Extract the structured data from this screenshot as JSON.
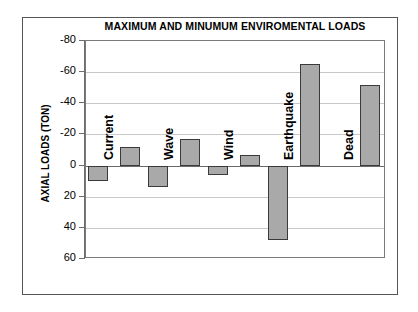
{
  "chart_data": {
    "type": "bar",
    "title": "MAXIMUM AND MINUMUM ENVIROMENTAL LOADS",
    "xlabel": "",
    "ylabel": "AXIAL LOADS (TON)",
    "ylim": [
      -80,
      60
    ],
    "y_axis_inverted": true,
    "yticks": [
      -80,
      -60,
      -40,
      -20,
      0,
      20,
      40,
      60
    ],
    "ytick_labels": [
      "-80",
      "-60",
      "-40",
      "-20",
      "0",
      "20",
      "40",
      "60"
    ],
    "grid": true,
    "legend": "none",
    "categories": [
      "Current",
      "Wave",
      "Wind",
      "Earthquake",
      "Dead"
    ],
    "series": [
      {
        "name": "Minimum",
        "values": [
          10,
          14,
          6,
          48,
          null
        ]
      },
      {
        "name": "Maximum",
        "values": [
          -12,
          -17,
          -7,
          -65,
          -52
        ]
      }
    ],
    "bars": [
      {
        "category": "Current",
        "series": "Minimum",
        "value": 10
      },
      {
        "category": "Current",
        "series": "Maximum",
        "value": -12
      },
      {
        "category": "Wave",
        "series": "Minimum",
        "value": 14
      },
      {
        "category": "Wave",
        "series": "Maximum",
        "value": -17
      },
      {
        "category": "Wind",
        "series": "Minimum",
        "value": 6
      },
      {
        "category": "Wind",
        "series": "Maximum",
        "value": -7
      },
      {
        "category": "Earthquake",
        "series": "Minimum",
        "value": 48
      },
      {
        "category": "Earthquake",
        "series": "Maximum",
        "value": -65
      },
      {
        "category": "Dead",
        "series": "Maximum",
        "value": -52
      }
    ],
    "colors": {
      "bar_fill": "#a9a9a9",
      "bar_edge": "#3a3a3a",
      "gridline": "#c9c9c9",
      "axis": "#6d6d6d",
      "background": "#ffffff",
      "text": "#000000"
    }
  }
}
